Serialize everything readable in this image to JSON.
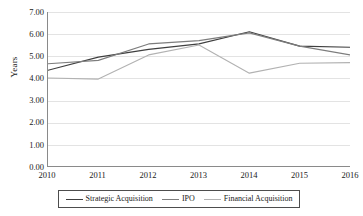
{
  "chart_data": {
    "type": "line",
    "title": "",
    "xlabel": "",
    "ylabel": "Years",
    "categories": [
      "2010",
      "2011",
      "2012",
      "2013",
      "2014",
      "2015",
      "2016"
    ],
    "ylim": [
      0,
      7
    ],
    "ytick_step": 1,
    "ytick_labels": [
      "7.00",
      "6.00",
      "5.00",
      "4.00",
      "3.00",
      "2.00",
      "1.00",
      "0.00"
    ],
    "ytick_values": [
      7,
      6,
      5,
      4,
      3,
      2,
      1,
      0
    ],
    "grid": true,
    "legend_position": "bottom",
    "series": [
      {
        "name": "Strategic Acquisition",
        "color": "#3f3f3f",
        "values": [
          4.35,
          4.95,
          5.3,
          5.55,
          6.1,
          5.45,
          5.4
        ]
      },
      {
        "name": "IPO",
        "color": "#7d7d7d",
        "values": [
          4.65,
          4.8,
          5.55,
          5.7,
          6.05,
          5.45,
          5.05
        ]
      },
      {
        "name": "Financial Acquisition",
        "color": "#b2b2b2",
        "values": [
          4.0,
          3.95,
          5.05,
          5.5,
          4.22,
          4.67,
          4.7
        ]
      }
    ]
  },
  "axes": {
    "axis_color": "#8a8a8a",
    "grid_color": "#e3e3e3"
  },
  "legend": {
    "border_color": "#4d4d4d"
  }
}
